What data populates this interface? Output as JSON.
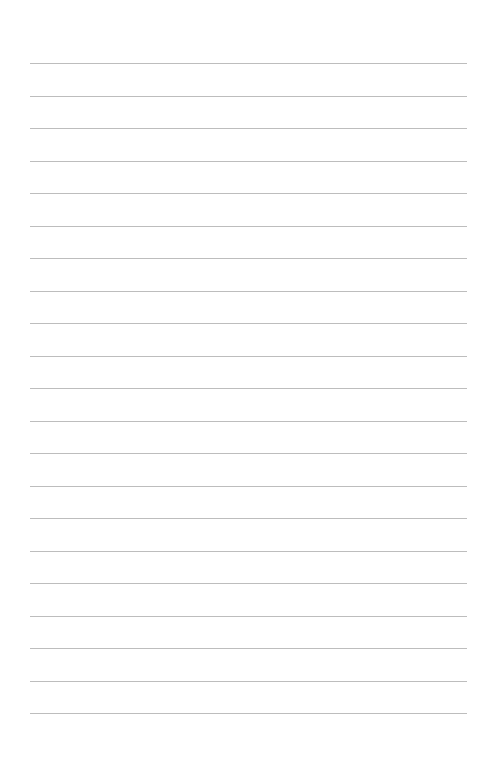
{
  "page": {
    "type": "blank ruled sheet",
    "background_color": "#ffffff"
  },
  "ruled_lines": {
    "count": 21,
    "color": "#bdbdbd"
  }
}
